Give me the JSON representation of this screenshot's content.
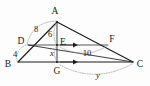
{
  "figure": {
    "background_color": "#fdfdfd",
    "ink_color": "#1c1c1c",
    "guide_color": "#9a9a9a",
    "vertices": [
      {
        "id": "A",
        "label": "A",
        "x": 57,
        "y": 22,
        "label_x": 55,
        "label_y": 14
      },
      {
        "id": "B",
        "label": "B",
        "x": 18,
        "y": 62,
        "label_x": 6,
        "label_y": 66
      },
      {
        "id": "C",
        "label": "C",
        "x": 133,
        "y": 62,
        "label_x": 137,
        "label_y": 66
      },
      {
        "id": "D",
        "label": "D",
        "x": 28,
        "y": 45,
        "label_x": 19,
        "label_y": 43
      },
      {
        "id": "E",
        "label": "E",
        "x": 57,
        "y": 45,
        "label_x": 60,
        "label_y": 44
      },
      {
        "id": "F",
        "label": "F",
        "x": 108,
        "y": 45,
        "label_x": 110,
        "label_y": 42
      },
      {
        "id": "G",
        "label": "G",
        "x": 57,
        "y": 62,
        "label_x": 54,
        "label_y": 73
      }
    ],
    "edges": [
      {
        "id": "AB",
        "from": "A",
        "to": "B",
        "style": "solid"
      },
      {
        "id": "AC",
        "from": "A",
        "to": "C",
        "style": "solid"
      },
      {
        "id": "BC",
        "from": "B",
        "to": "C",
        "style": "solid"
      },
      {
        "id": "DF",
        "from": "D",
        "to": "F",
        "style": "thin"
      },
      {
        "id": "AG",
        "from": "A",
        "to": "G",
        "style": "cevian"
      },
      {
        "id": "DC",
        "from": "D",
        "to": "C",
        "style": "cevian"
      }
    ],
    "measurements": [
      {
        "id": "AD",
        "label": "8",
        "italic": false,
        "x": 36,
        "y": 30,
        "segment": "A-D"
      },
      {
        "id": "DB",
        "label": "4",
        "italic": false,
        "x": 15,
        "y": 56,
        "segment": "D-B"
      },
      {
        "id": "AE",
        "label": "6",
        "italic": false,
        "x": 49,
        "y": 36,
        "segment": "A-E"
      },
      {
        "id": "EG",
        "label": "x",
        "italic": true,
        "x": 51,
        "y": 55,
        "segment": "E-G"
      },
      {
        "id": "EF",
        "label": "10",
        "italic": false,
        "x": 83,
        "y": 55,
        "segment": "E-F"
      },
      {
        "id": "GC",
        "label": "y",
        "italic": true,
        "x": 96,
        "y": 76,
        "segment": "G-C"
      }
    ]
  }
}
